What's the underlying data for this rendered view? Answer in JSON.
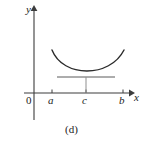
{
  "figure": {
    "caption": "(d)",
    "axes": {
      "y_label": "y",
      "x_label": "x",
      "origin_label": "0",
      "x_axis_y_px": 93,
      "y_axis_x_px": 34,
      "x_axis_range_px": [
        24,
        132
      ],
      "y_axis_range_px": [
        7,
        120
      ],
      "stroke_color": "#3c3c3c"
    },
    "ticks": [
      {
        "name": "a",
        "label": "a",
        "x_px": 52
      },
      {
        "name": "c",
        "label": "c",
        "x_px": 86
      },
      {
        "name": "b",
        "label": "b",
        "x_px": 123
      }
    ],
    "curve": {
      "name": "convex-function-curve",
      "type": "parabola-convex",
      "color": "#2b2b2b",
      "start_px": [
        52,
        50
      ],
      "vertex_px": [
        86,
        76
      ],
      "end_px": [
        124,
        50
      ],
      "control_left_px": [
        63,
        78
      ],
      "control_right_px": [
        110,
        78
      ]
    },
    "tangent_line": {
      "name": "horizontal-tangent-line",
      "color": "#5a5a5a",
      "y_px": 77,
      "x_start_px": 57,
      "x_end_px": 115
    },
    "drop_line": {
      "name": "vertical-drop-line-at-c",
      "color": "#8a8a8a",
      "x_px": 86,
      "y_top_px": 77,
      "y_bottom_px": 93
    }
  }
}
